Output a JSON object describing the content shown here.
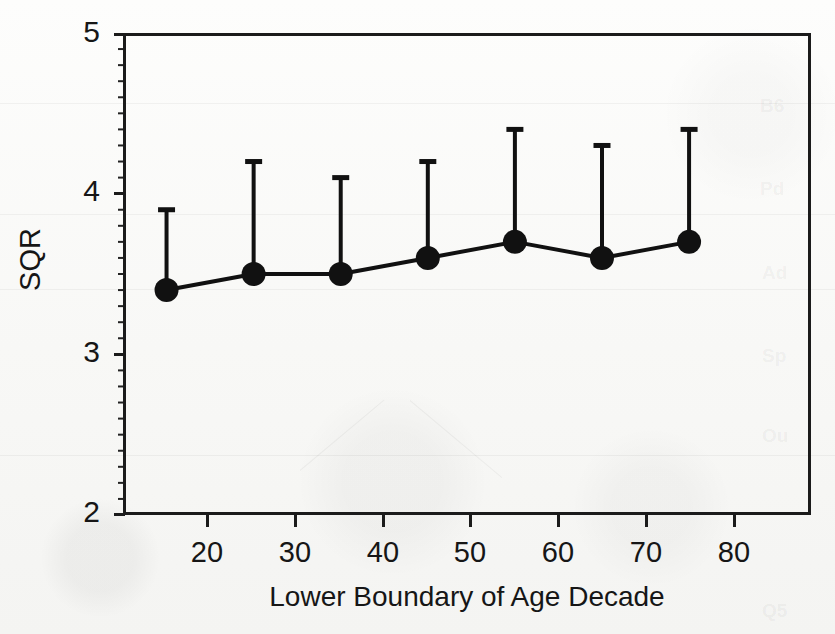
{
  "chart_data": {
    "type": "line",
    "title": "",
    "subtitle": "",
    "xlabel": "Lower Boundary of Age Decade",
    "ylabel": "SQR",
    "x": [
      20,
      30,
      40,
      50,
      60,
      70,
      80
    ],
    "values": [
      3.4,
      3.5,
      3.5,
      3.6,
      3.7,
      3.6,
      3.7
    ],
    "error_upper": [
      3.9,
      4.2,
      4.1,
      4.2,
      4.4,
      4.3,
      4.4
    ],
    "error_lower": [
      3.4,
      3.5,
      3.5,
      3.6,
      3.7,
      3.6,
      3.7
    ],
    "series": [
      {
        "name": "SQR",
        "values": [
          3.4,
          3.5,
          3.5,
          3.6,
          3.7,
          3.6,
          3.7
        ],
        "error_upper": [
          3.9,
          4.2,
          4.1,
          4.2,
          4.4,
          4.3,
          4.4
        ]
      }
    ],
    "xlim": [
      15,
      94
    ],
    "ylim": [
      2,
      5
    ],
    "x_tick_labels": [
      "20",
      "30",
      "40",
      "50",
      "60",
      "70",
      "80"
    ],
    "y_tick_labels": [
      "2",
      "3",
      "4",
      "5"
    ],
    "y_ticks": [
      2,
      3,
      4,
      5
    ],
    "y_minor_tick_interval": 0.1,
    "grid": false,
    "legend": "none",
    "marker": "filled-circle",
    "line_color": "#111111",
    "marker_color": "#111111",
    "error_bar_style": "upper-only-with-cap"
  },
  "axes": {
    "y_label": "SQR",
    "x_label": "Lower Boundary of Age Decade",
    "y_ticks": [
      {
        "label": "5",
        "value": 5
      },
      {
        "label": "4",
        "value": 4
      },
      {
        "label": "3",
        "value": 3
      },
      {
        "label": "2",
        "value": 2
      }
    ],
    "x_ticks": [
      {
        "label": "20",
        "value": 20
      },
      {
        "label": "30",
        "value": 30
      },
      {
        "label": "40",
        "value": 40
      },
      {
        "label": "50",
        "value": 50
      },
      {
        "label": "60",
        "value": 60
      },
      {
        "label": "70",
        "value": 70
      },
      {
        "label": "80",
        "value": 80
      }
    ]
  },
  "colors": {
    "ink": "#1b1b1b",
    "paper": "#fbfbfa"
  }
}
